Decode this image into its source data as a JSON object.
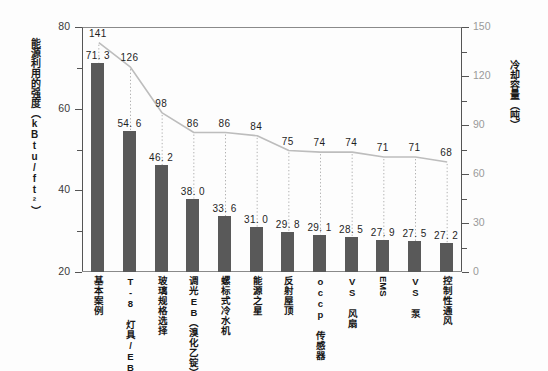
{
  "chart_data": {
    "type": "bar",
    "title": "",
    "subtitle": "",
    "categories": [
      "基本案例",
      "T-8 灯具/EB",
      "玻璃规格选择",
      "调光EB（溴化乙锭）",
      "螺标式冷水机",
      "能源之星",
      "反射屋顶",
      "occp 传感器",
      "VS 风扇",
      "EMS",
      "VS 泵",
      "控制性通风"
    ],
    "series": [
      {
        "name": "能源利用的强度",
        "type": "bar",
        "axis": "left",
        "unit": "kBtu/ft²",
        "values": [
          71.3,
          54.6,
          46.2,
          38.0,
          33.6,
          31.0,
          29.8,
          29.1,
          28.5,
          27.9,
          27.5,
          27.2
        ],
        "labels": [
          "71. 3",
          "54. 6",
          "46. 2",
          "38. 0",
          "33. 6",
          "31. 0",
          "29. 8",
          "29. 1",
          "28. 5",
          "27. 9",
          "27. 5",
          "27. 2"
        ]
      },
      {
        "name": "冷却容量",
        "type": "line",
        "axis": "right",
        "unit": "吨",
        "values": [
          141,
          126,
          98,
          86,
          86,
          84,
          75,
          74,
          74,
          71,
          71,
          68
        ],
        "labels": [
          "141",
          "126",
          "98",
          "86",
          "86",
          "84",
          "75",
          "74",
          "74",
          "71",
          "71",
          "68"
        ]
      }
    ],
    "xlabel": "",
    "ylabel": "能源利用的强度（kBtu/ft²）",
    "y2label": "冷却容量（吨）",
    "ylim": [
      20,
      80
    ],
    "y2lim": [
      0,
      150
    ],
    "yticks": [
      "20",
      "40",
      "60",
      "80"
    ],
    "y2ticks": [
      "0",
      "30",
      "60",
      "90",
      "120",
      "150"
    ],
    "grid": false,
    "legend": "none",
    "colors": {
      "bar": "#595959",
      "line": "#bdbdbd",
      "axis": "#555555",
      "text": "#1f1f1f",
      "right_tick_text": "#9a9a9a"
    }
  },
  "axes": {
    "left_title": "能源利用的强度（kBtu/ft²）",
    "right_title": "冷却容量（吨）"
  }
}
